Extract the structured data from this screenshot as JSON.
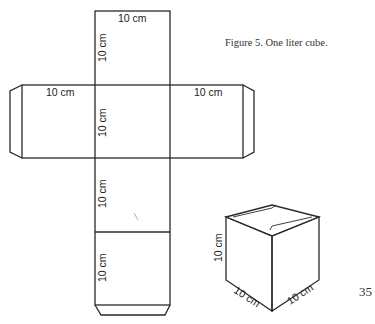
{
  "caption": "Figure 5. One liter cube.",
  "page_number": "35",
  "net": {
    "top_face_width_label": "10 cm",
    "top_face_height_label": "10 cm",
    "left_face_label": "10 cm",
    "center_face_label": "10 cm",
    "right_face_label": "10 cm",
    "lower_face_label": "10 cm",
    "bottom_face_label": "10 cm"
  },
  "cube": {
    "height_label": "10 cm",
    "left_depth_label": "10 cm",
    "right_depth_label": "10 cm"
  },
  "colors": {
    "line": "#2a2a2a",
    "text": "#222222",
    "background": "#ffffff"
  }
}
